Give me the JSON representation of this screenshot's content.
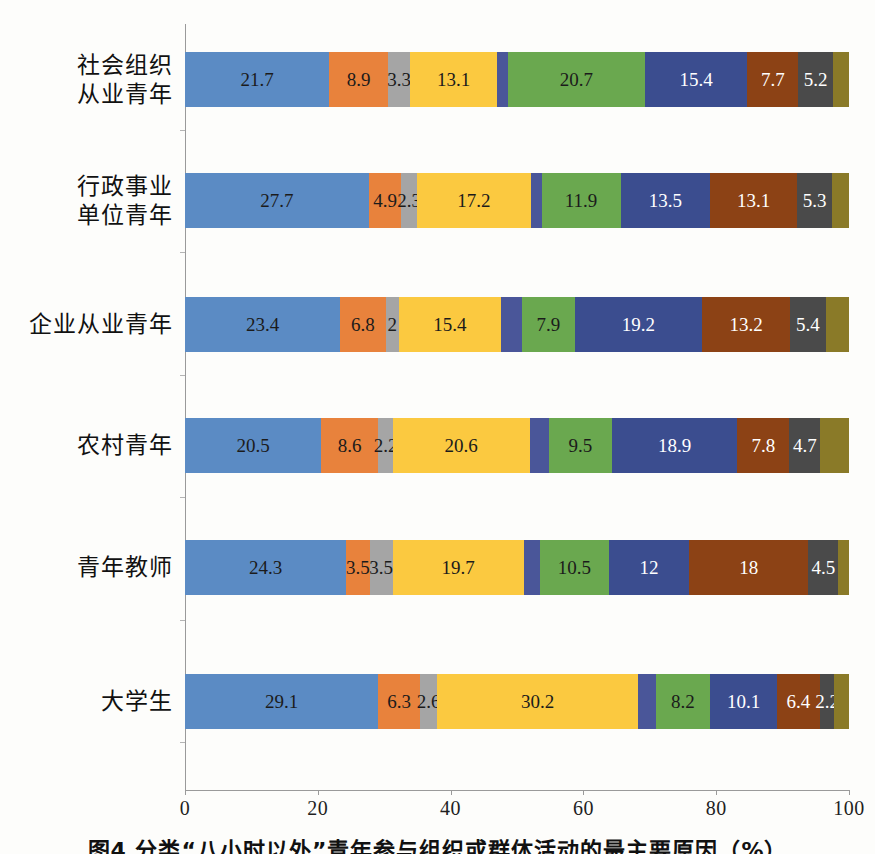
{
  "chart_data": {
    "type": "bar",
    "subtype": "stacked-horizontal-100",
    "title": "",
    "xlabel": "",
    "ylabel": "",
    "xlim": [
      0,
      100
    ],
    "xticks": [
      "0",
      "20",
      "40",
      "60",
      "80",
      "100"
    ],
    "xtick_values": [
      0,
      20,
      40,
      60,
      80,
      100
    ],
    "grid": false,
    "legend": "none",
    "orientation": "horizontal",
    "categories": [
      "社会组织\n从业青年",
      "行政事业\n单位青年",
      "企业从业青年",
      "农村青年",
      "青年教师",
      "大学生"
    ],
    "category_lines": [
      [
        "社会组织",
        "从业青年"
      ],
      [
        "行政事业",
        "单位青年"
      ],
      [
        "企业从业青年"
      ],
      [
        "农村青年"
      ],
      [
        "青年教师"
      ],
      [
        "大学生"
      ]
    ],
    "series_colors": [
      "#5b8bc4",
      "#e8823c",
      "#a5a5a5",
      "#fbc940",
      "#4a5699",
      "#6aa84f",
      "#3b4d8f",
      "#8c4215",
      "#4a4a4a",
      "#8a7a28"
    ],
    "series": [
      {
        "name": "series-1",
        "color": "#5b8bc4",
        "values": [
          21.7,
          27.7,
          23.4,
          20.5,
          24.3,
          29.1
        ],
        "labels": [
          "21.7",
          "27.7",
          "23.4",
          "20.5",
          "24.3",
          "29.1"
        ]
      },
      {
        "name": "series-2",
        "color": "#e8823c",
        "values": [
          8.9,
          4.9,
          6.8,
          8.6,
          3.5,
          6.3
        ],
        "labels": [
          "8.9",
          "4.9",
          "6.8",
          "8.6",
          "3.5",
          "6.3"
        ]
      },
      {
        "name": "series-3",
        "color": "#a5a5a5",
        "values": [
          3.3,
          2.3,
          2.0,
          2.2,
          3.5,
          2.6
        ],
        "labels": [
          "3.3",
          "2.3",
          "2",
          "2.2",
          "3.5",
          "2.6"
        ]
      },
      {
        "name": "series-4",
        "color": "#fbc940",
        "values": [
          13.1,
          17.2,
          15.4,
          20.6,
          19.7,
          30.2
        ],
        "labels": [
          "13.1",
          "17.2",
          "15.4",
          "20.6",
          "19.7",
          "30.2"
        ]
      },
      {
        "name": "series-5",
        "color": "#4a5699",
        "values": [
          1.6,
          1.6,
          3.2,
          2.9,
          2.4,
          2.7
        ],
        "labels": [
          "",
          "",
          "",
          "",
          "",
          ""
        ]
      },
      {
        "name": "series-6",
        "color": "#6aa84f",
        "values": [
          20.7,
          11.9,
          7.9,
          9.5,
          10.5,
          8.2
        ],
        "labels": [
          "20.7",
          "11.9",
          "7.9",
          "9.5",
          "10.5",
          "8.2"
        ]
      },
      {
        "name": "series-7",
        "color": "#3b4d8f",
        "values": [
          15.4,
          13.5,
          19.2,
          18.9,
          12.0,
          10.1
        ],
        "labels": [
          "15.4",
          "13.5",
          "19.2",
          "18.9",
          "12",
          "10.1"
        ]
      },
      {
        "name": "series-8",
        "color": "#8c4215",
        "values": [
          7.7,
          13.1,
          13.2,
          7.8,
          18.0,
          6.4
        ],
        "labels": [
          "7.7",
          "13.1",
          "13.2",
          "7.8",
          "18",
          "6.4"
        ]
      },
      {
        "name": "series-9",
        "color": "#4a4a4a",
        "values": [
          5.2,
          5.3,
          5.4,
          4.7,
          4.5,
          2.2
        ],
        "labels": [
          "5.2",
          "5.3",
          "5.4",
          "4.7",
          "4.5",
          "2.2"
        ]
      },
      {
        "name": "series-10",
        "color": "#8a7a28",
        "values": [
          2.4,
          2.5,
          3.5,
          4.3,
          1.6,
          2.2
        ],
        "labels": [
          "",
          "",
          "",
          "",
          "",
          ""
        ]
      }
    ],
    "label_text_colors": [
      "dark",
      "dark",
      "dark",
      "dark",
      "dark",
      "dark",
      "light",
      "light",
      "light",
      "dark"
    ]
  },
  "caption": {
    "text": "图4  分类“八小时以外”青年参与组织或群体活动的最主要原因（%）"
  }
}
